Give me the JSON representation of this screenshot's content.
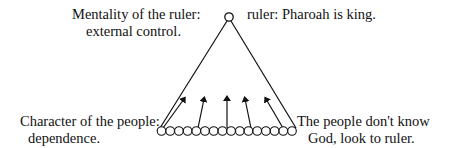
{
  "diagram": {
    "type": "hierarchy-triangle",
    "apex": {
      "role": "ruler"
    },
    "base": {
      "role": "people",
      "node_count": 16,
      "arrow_count": 5,
      "arrow_direction": "up"
    },
    "labels": {
      "top_left": {
        "line1": "Mentality of the ruler:",
        "line2": "external control."
      },
      "top_right": {
        "line1": "ruler: Pharoah is king."
      },
      "bottom_left": {
        "line1": "Character of the people:",
        "line2": "dependence."
      },
      "bottom_right": {
        "line1": "The people don't know",
        "line2": "God, look to ruler."
      }
    },
    "colors": {
      "ink": "#111111",
      "background": "#ffffff"
    }
  }
}
